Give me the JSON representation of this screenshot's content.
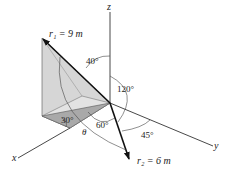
{
  "figure": {
    "axes": {
      "x": "x",
      "y": "y",
      "z": "z"
    },
    "vectors": [
      {
        "name": "r1",
        "label": "r₁ = 9 m"
      },
      {
        "name": "r2",
        "label": "r₂ = 6 m"
      }
    ],
    "angles": {
      "a40": "40°",
      "a120": "120°",
      "a30": "30°",
      "a60": "60°",
      "a45": "45°",
      "theta": "θ"
    },
    "colors": {
      "line": "#222222",
      "shade_light": "#d4d4d4",
      "shade_dark": "#a9a9a9"
    }
  }
}
